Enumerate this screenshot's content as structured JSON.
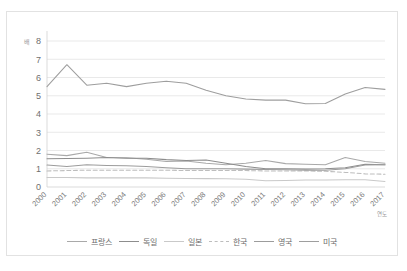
{
  "page": {
    "top_text": "",
    "bottom_text": ""
  },
  "chart_data": {
    "type": "line",
    "title": "",
    "subtitle": "",
    "xlabel": "연도",
    "ylabel": "배",
    "y_unit_label": "배",
    "x": [
      "2000",
      "2001",
      "2002",
      "2003",
      "2004",
      "2005",
      "2006",
      "2007",
      "2008",
      "2009",
      "2010",
      "2011",
      "2012",
      "2013",
      "2014",
      "2015",
      "2016",
      "2017"
    ],
    "categories": [
      "2000",
      "2001",
      "2002",
      "2003",
      "2004",
      "2005",
      "2006",
      "2007",
      "2008",
      "2009",
      "2010",
      "2011",
      "2012",
      "2013",
      "2014",
      "2015",
      "2016",
      "2017"
    ],
    "ylim": [
      0,
      8
    ],
    "yticks": [
      0,
      1,
      2,
      3,
      4,
      5,
      6,
      7,
      8
    ],
    "ytick_labels": [
      "0",
      "1",
      "2",
      "3",
      "4",
      "5",
      "6",
      "7",
      "8"
    ],
    "grid": true,
    "legend_position": "bottom",
    "series": [
      {
        "name": "프랑스",
        "color": "#a9a9a9",
        "dash": "none",
        "values": [
          1.8,
          1.72,
          1.9,
          1.62,
          1.6,
          1.52,
          1.4,
          1.42,
          1.3,
          1.22,
          1.3,
          1.45,
          1.28,
          1.25,
          1.22,
          1.62,
          1.4,
          1.3
        ]
      },
      {
        "name": "독일",
        "color": "#8d8d8d",
        "dash": "none",
        "values": [
          1.55,
          1.56,
          1.58,
          1.62,
          1.58,
          1.58,
          1.5,
          1.45,
          1.48,
          1.3,
          1.12,
          1.0,
          1.0,
          0.98,
          1.0,
          1.05,
          1.25,
          1.22
        ]
      },
      {
        "name": "일본",
        "color": "#c9c9c9",
        "dash": "none",
        "values": [
          0.52,
          0.52,
          0.5,
          0.5,
          0.5,
          0.5,
          0.48,
          0.46,
          0.46,
          0.45,
          0.42,
          0.34,
          0.36,
          0.38,
          0.38,
          0.4,
          0.4,
          0.3
        ]
      },
      {
        "name": "한국",
        "color": "#bdbdbd",
        "dash": "dashed",
        "values": [
          0.88,
          0.9,
          0.92,
          0.92,
          0.92,
          0.92,
          0.92,
          0.9,
          0.9,
          0.9,
          0.9,
          0.88,
          0.88,
          0.88,
          0.86,
          0.8,
          0.72,
          0.7
        ]
      },
      {
        "name": "영국",
        "color": "#9c9c9c",
        "dash": "none",
        "values": [
          1.2,
          1.12,
          1.22,
          1.18,
          1.16,
          1.12,
          1.05,
          1.0,
          1.0,
          1.0,
          0.98,
          0.96,
          0.94,
          0.92,
          0.92,
          1.0,
          1.2,
          1.22
        ]
      },
      {
        "name": "미국",
        "color": "#9e9e9e",
        "dash": "none",
        "values": [
          5.5,
          6.7,
          5.58,
          5.68,
          5.5,
          5.68,
          5.8,
          5.68,
          5.3,
          5.0,
          4.82,
          4.76,
          4.76,
          4.56,
          4.58,
          5.1,
          5.45,
          5.35
        ]
      }
    ]
  }
}
